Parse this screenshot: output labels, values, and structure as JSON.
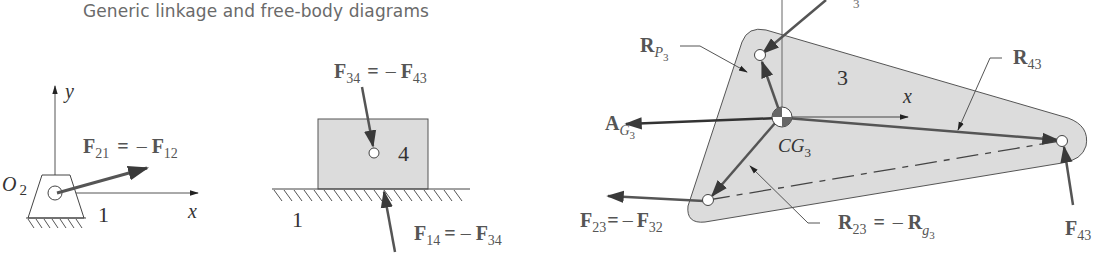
{
  "title": "Generic linkage and free-body diagrams",
  "colors": {
    "link_fill": "#dcdcdc",
    "outline": "#444444",
    "force_arrow": "#555555",
    "label": "#555555"
  },
  "ground_link": {
    "pivot_label": "O",
    "pivot_sub": "2",
    "link_number": "1",
    "axis_x": "x",
    "axis_y": "y",
    "force": {
      "name": "F",
      "sub": "21",
      "eq": "=",
      "neg": "–",
      "name2": "F",
      "sub2": "12"
    }
  },
  "slider": {
    "link_number": "4",
    "ground_number": "1",
    "force_top": {
      "name": "F",
      "sub": "34",
      "eq": "=",
      "neg": "–",
      "name2": "F",
      "sub2": "43"
    },
    "force_bottom": {
      "name": "F",
      "sub": "14",
      "eq": "=",
      "neg": "–",
      "name2": "F",
      "sub2": "34"
    }
  },
  "coupler": {
    "link_number": "3",
    "axis_x": "x",
    "cg": {
      "name": "CG",
      "sub": "3"
    },
    "accel": {
      "name": "A",
      "sub": "G",
      "subsub": "3"
    },
    "r_p3": {
      "name": "R",
      "sub": "P",
      "subsub": "3"
    },
    "r_43": {
      "name": "R",
      "sub": "43"
    },
    "f_43": {
      "name": "F",
      "sub": "43"
    },
    "f_23": {
      "name": "F",
      "sub": "23",
      "eq": "=",
      "neg": "–",
      "name2": "F",
      "sub2": "32"
    },
    "r_23": {
      "name": "R",
      "sub": "23",
      "eq": "=",
      "neg": "–",
      "name2": "R",
      "sub2": "g",
      "subsub2": "3"
    },
    "top_cut_sub": "3"
  }
}
